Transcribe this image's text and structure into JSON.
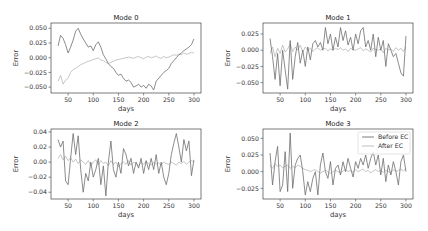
{
  "figure": {
    "width": 428,
    "height": 231,
    "line_colors": {
      "before": "#6f6f6f",
      "after": "#b8b8b8"
    },
    "frame_color": "#444444"
  },
  "chart_data": [
    {
      "type": "line",
      "title": "Mode 0",
      "xlabel": "days",
      "ylabel": "Error",
      "xlim": [
        16,
        314
      ],
      "ylim": [
        -0.06,
        0.059
      ],
      "xticks": [
        50,
        100,
        150,
        200,
        250,
        300
      ],
      "yticks": [
        0.05,
        0.025,
        0.0,
        -0.025,
        -0.05
      ],
      "ytick_labels": [
        "0.050",
        "0.025",
        "0.000",
        "−0.025",
        "−0.050"
      ],
      "grid": false,
      "frame": {
        "x": 51,
        "y": 23,
        "w": 150,
        "h": 70
      },
      "series": [
        {
          "name": "Before EC",
          "x": [
            30,
            35,
            40,
            45,
            50,
            55,
            60,
            65,
            70,
            75,
            80,
            85,
            90,
            95,
            100,
            105,
            110,
            115,
            120,
            125,
            130,
            135,
            140,
            145,
            150,
            155,
            160,
            165,
            170,
            175,
            180,
            185,
            190,
            195,
            200,
            205,
            210,
            215,
            220,
            225,
            230,
            235,
            240,
            245,
            250,
            255,
            260,
            265,
            270,
            275,
            280,
            285,
            290,
            295,
            300
          ],
          "values": [
            0.02,
            0.038,
            0.033,
            0.022,
            0.008,
            0.018,
            0.03,
            0.045,
            0.05,
            0.04,
            0.032,
            0.025,
            0.018,
            0.02,
            0.012,
            0.022,
            0.027,
            0.018,
            0.005,
            -0.002,
            -0.01,
            -0.015,
            -0.018,
            -0.025,
            -0.03,
            -0.028,
            -0.035,
            -0.04,
            -0.038,
            -0.042,
            -0.05,
            -0.048,
            -0.045,
            -0.05,
            -0.047,
            -0.052,
            -0.045,
            -0.048,
            -0.055,
            -0.04,
            -0.035,
            -0.03,
            -0.025,
            -0.022,
            -0.018,
            -0.01,
            -0.005,
            0.0,
            0.005,
            0.008,
            0.012,
            0.015,
            0.018,
            0.022,
            0.032
          ]
        },
        {
          "name": "After EC",
          "x": [
            30,
            35,
            40,
            45,
            50,
            55,
            60,
            65,
            70,
            75,
            80,
            85,
            90,
            95,
            100,
            105,
            110,
            115,
            120,
            125,
            130,
            135,
            140,
            145,
            150,
            155,
            160,
            165,
            170,
            175,
            180,
            185,
            190,
            195,
            200,
            205,
            210,
            215,
            220,
            225,
            230,
            235,
            240,
            245,
            250,
            255,
            260,
            265,
            270,
            275,
            280,
            285,
            290,
            295,
            300
          ],
          "values": [
            -0.04,
            -0.03,
            -0.045,
            -0.038,
            -0.035,
            -0.025,
            -0.02,
            -0.018,
            -0.015,
            -0.012,
            -0.01,
            -0.008,
            -0.006,
            -0.005,
            -0.003,
            -0.002,
            0.0,
            -0.004,
            -0.005,
            -0.008,
            -0.01,
            -0.008,
            -0.006,
            -0.004,
            -0.003,
            -0.002,
            -0.001,
            0.0,
            0.001,
            0.0,
            -0.001,
            0.001,
            0.002,
            0.0,
            -0.002,
            0.001,
            0.002,
            0.0,
            0.001,
            0.003,
            0.0,
            -0.001,
            0.002,
            0.0,
            0.001,
            0.003,
            0.005,
            0.004,
            0.006,
            0.005,
            0.008,
            0.006,
            0.007,
            0.009,
            0.008
          ]
        }
      ]
    },
    {
      "type": "line",
      "title": "Mode 1",
      "xlabel": "days",
      "ylabel": "Error",
      "xlim": [
        16,
        314
      ],
      "ylim": [
        -0.066,
        0.042
      ],
      "xticks": [
        50,
        100,
        150,
        200,
        250,
        300
      ],
      "yticks": [
        0.025,
        0.0,
        -0.025,
        -0.05
      ],
      "ytick_labels": [
        "0.025",
        "0.000",
        "−0.025",
        "−0.050"
      ],
      "grid": false,
      "frame": {
        "x": 263,
        "y": 23,
        "w": 150,
        "h": 70
      },
      "series": [
        {
          "name": "Before EC",
          "x": [
            30,
            35,
            40,
            45,
            50,
            55,
            60,
            65,
            70,
            75,
            80,
            85,
            90,
            95,
            100,
            105,
            110,
            115,
            120,
            125,
            130,
            135,
            140,
            145,
            150,
            155,
            160,
            165,
            170,
            175,
            180,
            185,
            190,
            195,
            200,
            205,
            210,
            215,
            220,
            225,
            230,
            235,
            240,
            245,
            250,
            255,
            260,
            265,
            270,
            275,
            280,
            285,
            290,
            295,
            300
          ],
          "values": [
            0.018,
            -0.01,
            -0.045,
            -0.005,
            -0.055,
            0.0,
            -0.03,
            -0.06,
            0.015,
            -0.045,
            -0.01,
            0.012,
            -0.02,
            0.0,
            -0.025,
            0.005,
            -0.015,
            0.01,
            0.015,
            0.005,
            0.012,
            0.0,
            0.035,
            0.01,
            0.025,
            0.0,
            0.02,
            0.005,
            0.035,
            0.015,
            0.03,
            0.008,
            0.02,
            0.0,
            0.025,
            0.01,
            0.03,
            0.035,
            0.005,
            0.015,
            0.0,
            0.025,
            -0.01,
            0.02,
            0.0,
            0.015,
            -0.025,
            0.01,
            0.0,
            -0.01,
            -0.005,
            -0.02,
            -0.035,
            -0.04,
            0.022
          ]
        },
        {
          "name": "After EC",
          "x": [
            30,
            35,
            40,
            45,
            50,
            55,
            60,
            65,
            70,
            75,
            80,
            85,
            90,
            95,
            100,
            105,
            110,
            115,
            120,
            125,
            130,
            135,
            140,
            145,
            150,
            155,
            160,
            165,
            170,
            175,
            180,
            185,
            190,
            195,
            200,
            205,
            210,
            215,
            220,
            225,
            230,
            235,
            240,
            245,
            250,
            255,
            260,
            265,
            270,
            275,
            280,
            285,
            290,
            295,
            300
          ],
          "values": [
            -0.005,
            0.005,
            -0.01,
            0.003,
            -0.005,
            0.008,
            -0.003,
            0.002,
            0.01,
            -0.002,
            0.005,
            0.0,
            0.008,
            -0.003,
            0.005,
            0.0,
            0.003,
            -0.002,
            0.002,
            0.004,
            0.0,
            0.002,
            0.003,
            -0.001,
            0.002,
            0.0,
            0.003,
            0.001,
            0.004,
            0.0,
            0.002,
            -0.002,
            0.003,
            0.001,
            0.0,
            0.002,
            0.004,
            -0.001,
            0.002,
            0.0,
            -0.003,
            0.003,
            0.001,
            0.0,
            0.002,
            -0.004,
            0.003,
            0.0,
            0.002,
            -0.002,
            0.004,
            0.0,
            0.003,
            -0.002,
            0.005
          ]
        }
      ]
    },
    {
      "type": "line",
      "title": "Mode 2",
      "xlabel": "days",
      "ylabel": "Error",
      "xlim": [
        16,
        314
      ],
      "ylim": [
        -0.049,
        0.044
      ],
      "xticks": [
        50,
        100,
        150,
        200,
        250,
        300
      ],
      "yticks": [
        0.04,
        0.02,
        0.0,
        -0.02,
        -0.04
      ],
      "ytick_labels": [
        "0.04",
        "0.02",
        "0.00",
        "−0.02",
        "−0.04"
      ],
      "grid": false,
      "frame": {
        "x": 51,
        "y": 129,
        "w": 150,
        "h": 70
      },
      "series": [
        {
          "name": "Before EC",
          "x": [
            30,
            35,
            40,
            45,
            50,
            55,
            60,
            65,
            70,
            75,
            80,
            85,
            90,
            95,
            100,
            105,
            110,
            115,
            120,
            125,
            130,
            135,
            140,
            145,
            150,
            155,
            160,
            165,
            170,
            175,
            180,
            185,
            190,
            195,
            200,
            205,
            210,
            215,
            220,
            225,
            230,
            235,
            240,
            245,
            250,
            255,
            260,
            265,
            270,
            275,
            280,
            285,
            290,
            295,
            300
          ],
          "values": [
            0.03,
            0.02,
            0.028,
            -0.025,
            -0.03,
            0.005,
            0.038,
            0.01,
            0.035,
            -0.01,
            -0.04,
            -0.015,
            -0.025,
            0.0,
            -0.02,
            -0.01,
            0.005,
            -0.03,
            -0.005,
            -0.045,
            0.0,
            0.028,
            -0.01,
            -0.02,
            0.0,
            -0.015,
            0.018,
            0.01,
            -0.005,
            0.005,
            -0.015,
            0.0,
            -0.008,
            0.005,
            -0.015,
            0.002,
            -0.01,
            0.005,
            -0.01,
            0.01,
            -0.015,
            0.0,
            -0.02,
            -0.03,
            -0.015,
            0.01,
            0.025,
            0.038,
            0.02,
            0.0,
            0.03,
            0.015,
            0.028,
            -0.018,
            0.003
          ]
        },
        {
          "name": "After EC",
          "x": [
            30,
            35,
            40,
            45,
            50,
            55,
            60,
            65,
            70,
            75,
            80,
            85,
            90,
            95,
            100,
            105,
            110,
            115,
            120,
            125,
            130,
            135,
            140,
            145,
            150,
            155,
            160,
            165,
            170,
            175,
            180,
            185,
            190,
            195,
            200,
            205,
            210,
            215,
            220,
            225,
            230,
            235,
            240,
            245,
            250,
            255,
            260,
            265,
            270,
            275,
            280,
            285,
            290,
            295,
            300
          ],
          "values": [
            0.005,
            0.01,
            0.003,
            0.008,
            0.002,
            0.006,
            0.0,
            0.004,
            -0.002,
            0.003,
            0.0,
            -0.003,
            0.002,
            -0.005,
            0.0,
            0.003,
            -0.004,
            0.002,
            -0.002,
            0.0,
            -0.005,
            0.002,
            -0.003,
            0.0,
            -0.006,
            -0.002,
            0.0,
            -0.003,
            0.002,
            -0.004,
            0.0,
            -0.002,
            -0.005,
            0.0,
            -0.003,
            0.001,
            -0.002,
            -0.004,
            0.0,
            -0.003,
            -0.001,
            -0.004,
            0.0,
            -0.002,
            -0.003,
            0.0,
            -0.002,
            -0.004,
            0.0,
            -0.002,
            0.001,
            -0.003,
            0.0,
            0.002,
            0.0
          ]
        }
      ]
    },
    {
      "type": "line",
      "title": "Mode 3",
      "xlabel": "days",
      "ylabel": "Error",
      "xlim": [
        16,
        314
      ],
      "ylim": [
        -0.041,
        0.064
      ],
      "xticks": [
        50,
        100,
        150,
        200,
        250,
        300
      ],
      "yticks": [
        0.05,
        0.025,
        0.0,
        -0.025
      ],
      "ytick_labels": [
        "0.050",
        "0.025",
        "0.000",
        "−0.025"
      ],
      "grid": false,
      "frame": {
        "x": 263,
        "y": 129,
        "w": 150,
        "h": 70
      },
      "legend": {
        "position": "upper right",
        "entries": [
          "Before EC",
          "After EC"
        ]
      },
      "series": [
        {
          "name": "Before EC",
          "x": [
            30,
            35,
            40,
            45,
            50,
            55,
            60,
            65,
            70,
            75,
            80,
            85,
            90,
            95,
            100,
            105,
            110,
            115,
            120,
            125,
            130,
            135,
            140,
            145,
            150,
            155,
            160,
            165,
            170,
            175,
            180,
            185,
            190,
            195,
            200,
            205,
            210,
            215,
            220,
            225,
            230,
            235,
            240,
            245,
            250,
            255,
            260,
            265,
            270,
            275,
            280,
            285,
            290,
            295,
            300
          ],
          "values": [
            0.028,
            -0.02,
            0.015,
            0.038,
            -0.03,
            -0.02,
            0.03,
            -0.03,
            0.058,
            -0.025,
            0.01,
            0.02,
            0.025,
            0.0,
            -0.035,
            -0.015,
            -0.03,
            -0.01,
            0.0,
            -0.035,
            0.01,
            0.028,
            0.0,
            -0.01,
            0.015,
            -0.02,
            0.005,
            0.01,
            -0.005,
            0.015,
            0.0,
            0.02,
            0.005,
            -0.008,
            0.015,
            0.005,
            0.02,
            0.01,
            0.025,
            0.005,
            0.02,
            0.03,
            0.01,
            0.025,
            -0.005,
            0.02,
            -0.015,
            0.01,
            -0.005,
            0.015,
            0.0,
            -0.02,
            0.015,
            0.025,
            0.0
          ]
        },
        {
          "name": "After EC",
          "x": [
            30,
            35,
            40,
            45,
            50,
            55,
            60,
            65,
            70,
            75,
            80,
            85,
            90,
            95,
            100,
            105,
            110,
            115,
            120,
            125,
            130,
            135,
            140,
            145,
            150,
            155,
            160,
            165,
            170,
            175,
            180,
            185,
            190,
            195,
            200,
            205,
            210,
            215,
            220,
            225,
            230,
            235,
            240,
            245,
            250,
            255,
            260,
            265,
            270,
            275,
            280,
            285,
            290,
            295,
            300
          ],
          "values": [
            0.01,
            0.005,
            0.012,
            0.008,
            0.01,
            0.006,
            0.008,
            0.01,
            0.005,
            0.008,
            0.006,
            0.01,
            0.008,
            0.005,
            0.003,
            0.002,
            0.0,
            0.002,
            0.003,
            0.0,
            -0.002,
            0.0,
            0.002,
            0.0,
            -0.003,
            0.0,
            0.002,
            0.0,
            -0.002,
            0.001,
            0.003,
            0.0,
            0.002,
            -0.001,
            0.003,
            0.0,
            0.002,
            0.004,
            0.0,
            0.002,
            -0.002,
            0.001,
            0.003,
            0.0,
            0.002,
            -0.001,
            0.002,
            0.0,
            -0.002,
            0.003,
            0.0,
            0.002,
            0.004,
            0.001,
            0.005
          ]
        }
      ]
    }
  ]
}
